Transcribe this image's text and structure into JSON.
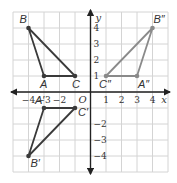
{
  "grid": {
    "x_range": [
      -5,
      5
    ],
    "y_range": [
      -5,
      5
    ],
    "origin_px": [
      90.5,
      92
    ],
    "unit_px": [
      15.5,
      16
    ],
    "grid_color": "#d4d4d4",
    "axis_color": "#222222"
  },
  "axes": {
    "x_label": "x",
    "y_label": "y",
    "origin_label": "O",
    "x_ticks": [
      {
        "value": -4,
        "label": "−4"
      },
      {
        "value": -3,
        "label": "−3"
      },
      {
        "value": -2,
        "label": "−2"
      },
      {
        "value": 1,
        "label": "1"
      },
      {
        "value": 2,
        "label": "2"
      },
      {
        "value": 3,
        "label": "3"
      },
      {
        "value": 4,
        "label": "4"
      }
    ],
    "y_ticks": [
      {
        "value": 4,
        "label": "4"
      },
      {
        "value": 3,
        "label": "3"
      },
      {
        "value": 2,
        "label": "2"
      },
      {
        "value": 1,
        "label": "1"
      },
      {
        "value": -2,
        "label": "−2"
      },
      {
        "value": -3,
        "label": "−3"
      },
      {
        "value": -4,
        "label": "−4"
      }
    ]
  },
  "triangles": [
    {
      "name": "ABC",
      "color": "#3a3a3a",
      "points": [
        {
          "label": "A",
          "x": -3,
          "y": 1
        },
        {
          "label": "B",
          "x": -4,
          "y": 4
        },
        {
          "label": "C",
          "x": -1,
          "y": 1
        }
      ]
    },
    {
      "name": "A'B'C'",
      "color": "#3a3a3a",
      "points": [
        {
          "label": "A′",
          "x": -3,
          "y": -1
        },
        {
          "label": "B′",
          "x": -4,
          "y": -4
        },
        {
          "label": "C′",
          "x": -1,
          "y": -1
        }
      ]
    },
    {
      "name": "A''B''C''",
      "color": "#8a8a8a",
      "points": [
        {
          "label": "A″",
          "x": 3,
          "y": 1
        },
        {
          "label": "B″",
          "x": 4,
          "y": 4
        },
        {
          "label": "C″",
          "x": 1,
          "y": 1
        }
      ]
    }
  ]
}
